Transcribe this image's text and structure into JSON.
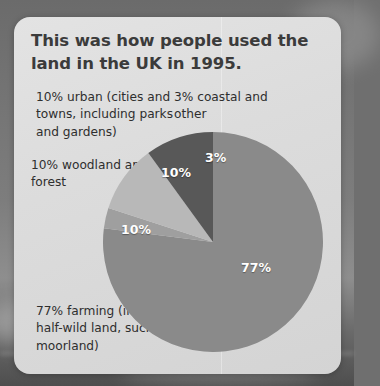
{
  "title": "This was how people used the land in the UK in 1995.",
  "labels": {
    "urban": "10% urban (cities and towns, including parks and gardens)",
    "coastal": "3% coastal and other",
    "woodland": "10% woodland and forest",
    "farming": "77% farming (including half-wild land, such as moorland)"
  },
  "slice_labels": {
    "farming": "77%",
    "woodland": "10%",
    "urban": "10%",
    "coastal": "3%"
  },
  "colors": {
    "card_background": "#dcdcdc",
    "title_text": "#3b3b3b",
    "body_text": "#2e2e2e",
    "slice_farming": "#8a8a8a",
    "slice_woodland": "#585858",
    "slice_urban": "#b8b8b8",
    "slice_coastal": "#9f9f9f",
    "slice_label_text": "#ffffff",
    "backdrop": "#6f6f6f"
  },
  "chart_data": {
    "type": "pie",
    "title": "This was how people used the land in the UK in 1995.",
    "categories": [
      "farming (including half-wild land, such as moorland)",
      "coastal and other",
      "urban (cities and towns, including parks and gardens)",
      "woodland and forest"
    ],
    "values": [
      77,
      3,
      10,
      10
    ],
    "unit": "percent",
    "data_labels": [
      "77%",
      "3%",
      "10%",
      "10%"
    ],
    "legend": "external callout labels",
    "grid": false,
    "start_angle_deg": 0,
    "direction": "clockwise",
    "slice_colors": [
      "#8a8a8a",
      "#9f9f9f",
      "#b8b8b8",
      "#585858"
    ]
  }
}
